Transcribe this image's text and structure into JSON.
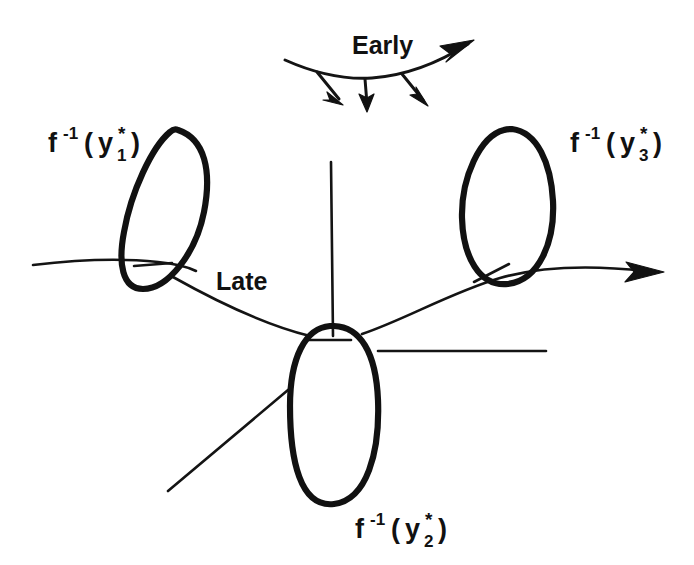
{
  "figure": {
    "background_color": "#ffffff",
    "ink_color": "#111111",
    "width": 694,
    "height": 565
  },
  "labels": {
    "early": "Early",
    "late": "Late",
    "fiber_1": {
      "f": "f",
      "exponent": "-1",
      "open_paren": "(",
      "variable": "y",
      "star": "*",
      "index": "1",
      "close_paren": ")",
      "plain": "f -1 ( y *1 )"
    },
    "fiber_2": {
      "f": "f",
      "exponent": "-1",
      "open_paren": "(",
      "variable": "y",
      "star": "*",
      "index": "2",
      "close_paren": ")",
      "plain": "f -1 ( y *2 )"
    },
    "fiber_3": {
      "f": "f",
      "exponent": "-1",
      "open_paren": "(",
      "variable": "y",
      "star": "*",
      "index": "3",
      "close_paren": ")",
      "plain": "f -1 ( y *3 )"
    }
  },
  "geometry": {
    "early_curve": "M 285 60 C 312 72 342 80 372 78 C 412 75 443 60 468 44",
    "early_arrowhead": "M 474 40 L 440 46 L 452 55 L 446 62 Z",
    "early_tick_arrows": [
      {
        "name": "early-tick-arrow-left",
        "shaft": "M 317 72 L 339 99",
        "head": "M 343 105 L 327 92 L 330 100 L 323 100 Z"
      },
      {
        "name": "early-tick-arrow-mid",
        "shaft": "M 365 79 L 367 104",
        "head": "M 367 112 L 359 94 L 367 98 L 374 94 Z"
      },
      {
        "name": "early-tick-arrow-right",
        "shaft": "M 402 74 L 423 100",
        "head": "M 428 106 L 410 95 L 417 94 L 416 87 Z"
      }
    ],
    "loop_left": "M 178 130 C 205 139 212 171 204 212 C 196 253 168 289 143 289 C 122 289 118 263 124 232 C 131 192 152 147 170 132 C 173 129 176 129 178 130 Z",
    "loop_right": "M 512 129 C 537 132 551 163 553 201 C 555 242 539 280 508 284 C 479 287 463 256 462 218 C 461 178 480 136 504 130 C 507 129 510 129 512 129 Z",
    "loop_bottom": "M 334 326 C 360 327 376 352 378 400 C 380 452 367 500 334 504 C 300 508 290 460 290 406 C 290 358 305 328 330 326 Z",
    "left_thin_curve": "M 33 265 C 75 260 120 258 158 262 C 178 264 190 268 196 271",
    "late_curve": "M 173 277 C 214 300 265 325 310 336",
    "right_rising_curve": "M 362 334 C 404 320 452 292 500 278 C 545 265 600 266 646 271",
    "right_arrowhead": "M 664 272 L 626 262 L 634 272 L 625 282 Z",
    "center_vertical_line": "M 331 162 L 333 336",
    "center_horizontal_line": "M 378 351 L 546 351",
    "lower_left_diagonal": "M 168 491 L 288 390",
    "tick_left_inside_left_loop": "M 134 266 L 172 263",
    "tick_inside_right_loop": "M 474 282 L 509 264",
    "tick_inside_bottom_loop": "M 307 340 L 351 340",
    "bottom_loop_upper_left_join": "M 288 390 L 292 384"
  },
  "label_positions": {
    "early": {
      "x": 352,
      "y": 54
    },
    "late": {
      "x": 216,
      "y": 290
    },
    "fiber_1": {
      "x": 48,
      "y": 152
    },
    "fiber_2": {
      "x": 355,
      "y": 538
    },
    "fiber_3": {
      "x": 570,
      "y": 152
    }
  }
}
